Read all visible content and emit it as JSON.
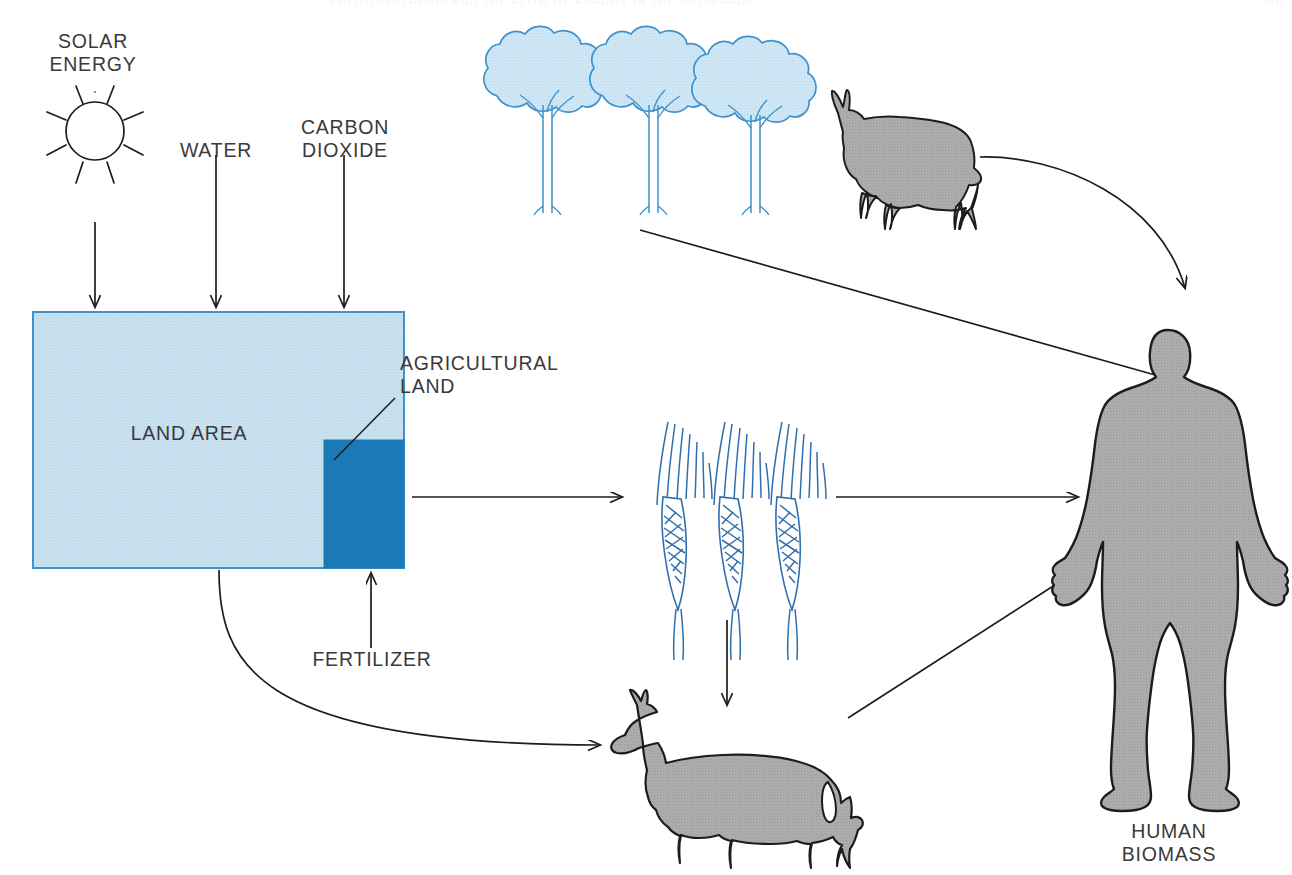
{
  "page": {
    "running_head": "PHOTOSYNTHESIS AND THE FLOW OF ENERGY IN THE BIOSPHERE",
    "folio": "201"
  },
  "colors": {
    "land_fill": "#c9e0ef",
    "land_stroke": "#3f92cb",
    "agricultural_fill": "#1a7ab8",
    "animal_fill": "#a8a8a8",
    "animal_stroke": "#1c1c1c",
    "plant_stroke": "#2f6fae",
    "tree_fill": "#cfe6f5",
    "line": "#1c1c1c",
    "text": "#3a3a3a"
  },
  "inputs": [
    {
      "id": "solar-energy",
      "label": "SOLAR\nENERGY",
      "x": 92,
      "y": 30
    },
    {
      "id": "water",
      "label": "WATER",
      "x": 215,
      "y": 139
    },
    {
      "id": "carbon-dioxide",
      "label": "CARBON\nDIOXIDE",
      "x": 344,
      "y": 116
    }
  ],
  "land": {
    "area_label": "LAND AREA",
    "agricultural_label": "AGRICULTURAL\nLAND",
    "fertilizer_label": "FERTILIZER",
    "rect": {
      "x": 33,
      "y": 312,
      "w": 371,
      "h": 256
    },
    "agricultural_rect": {
      "x": 324,
      "y": 440,
      "w": 80,
      "h": 128
    }
  },
  "biota": [
    {
      "id": "trees",
      "label": "",
      "count": 3
    },
    {
      "id": "goat",
      "label": ""
    },
    {
      "id": "wheat",
      "label": "",
      "count": 3
    },
    {
      "id": "cow",
      "label": ""
    }
  ],
  "output": {
    "human_label": "HUMAN\nBIOMASS",
    "x": 1168,
    "y": 792
  },
  "flows": [
    {
      "id": "solar-to-land",
      "from": "solar-energy",
      "to": "land-area"
    },
    {
      "id": "water-to-land",
      "from": "water",
      "to": "land-area"
    },
    {
      "id": "co2-to-land",
      "from": "carbon-dioxide",
      "to": "land-area"
    },
    {
      "id": "fertilizer-to-agland",
      "from": "fertilizer",
      "to": "agricultural-land"
    },
    {
      "id": "agland-to-wheat",
      "from": "agricultural-land",
      "to": "wheat"
    },
    {
      "id": "land-to-cow",
      "from": "land-area",
      "to": "cow"
    },
    {
      "id": "trees-to-human",
      "from": "trees",
      "to": "human"
    },
    {
      "id": "goat-to-human",
      "from": "goat",
      "to": "human"
    },
    {
      "id": "wheat-to-human",
      "from": "wheat",
      "to": "human"
    },
    {
      "id": "wheat-to-cow",
      "from": "wheat",
      "to": "cow"
    },
    {
      "id": "cow-to-human",
      "from": "cow",
      "to": "human"
    }
  ]
}
